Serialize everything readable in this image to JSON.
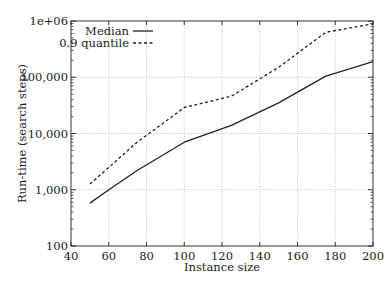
{
  "chart_data": {
    "type": "line",
    "title": "",
    "xlabel": "Instance size",
    "ylabel": "Run-time (search steps)",
    "xscale": "linear",
    "yscale": "log",
    "xlim": [
      40,
      200
    ],
    "ylim": [
      100,
      1000000
    ],
    "grid": true,
    "legend_position": "upper left",
    "x_ticks": [
      40,
      60,
      80,
      100,
      120,
      140,
      160,
      180,
      200
    ],
    "x_tick_labels": [
      "40",
      "60",
      "80",
      "100",
      "120",
      "140",
      "160",
      "180",
      "200"
    ],
    "y_ticks": [
      100,
      1000,
      10000,
      100000,
      1000000
    ],
    "y_tick_labels": [
      "100",
      "1,000",
      "10,000",
      "100,000",
      "1e+06"
    ],
    "x": [
      50,
      60,
      75,
      100,
      125,
      150,
      175,
      200
    ],
    "series": [
      {
        "name": "Median",
        "style": "solid",
        "values": [
          580,
          1000,
          2200,
          7000,
          14000,
          35000,
          105000,
          190000
        ]
      },
      {
        "name": "0.9 quantile",
        "style": "dashed",
        "values": [
          1260,
          2500,
          7000,
          29000,
          46000,
          150000,
          630000,
          890000
        ]
      }
    ]
  },
  "legend": {
    "items": [
      {
        "label": "Median",
        "style": "solid"
      },
      {
        "label": "0.9 quantile",
        "style": "dashed"
      }
    ]
  },
  "colors": {
    "line": "#222222",
    "grid": "#b5b5b5",
    "axis": "#333333"
  }
}
